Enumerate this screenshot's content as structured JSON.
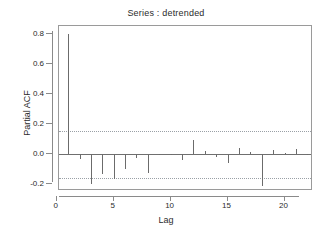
{
  "chart_data": {
    "type": "bar",
    "title": "Series : detrended",
    "xlabel": "Lag",
    "ylabel": "Partial ACF",
    "x": [
      1,
      2,
      3,
      4,
      5,
      6,
      7,
      8,
      9,
      10,
      11,
      12,
      13,
      14,
      15,
      16,
      17,
      18,
      19,
      20,
      21,
      22
    ],
    "values": [
      0.805,
      -0.03,
      -0.195,
      -0.13,
      -0.165,
      -0.095,
      -0.022,
      -0.125,
      -0.004,
      0.003,
      -0.04,
      0.095,
      0.025,
      -0.02,
      -0.06,
      0.04,
      0.012,
      -0.21,
      0.03,
      0.01,
      0.035,
      0.004
    ],
    "categories": [
      "1",
      "2",
      "3",
      "4",
      "5",
      "6",
      "7",
      "8",
      "9",
      "10",
      "11",
      "12",
      "13",
      "14",
      "15",
      "16",
      "17",
      "18",
      "19",
      "20",
      "21",
      "22"
    ],
    "xlim": [
      0.2,
      22.5
    ],
    "ylim": [
      -0.245,
      0.855
    ],
    "yticks": [
      0.8,
      0.6,
      0.4,
      0.2,
      0.0,
      -0.2
    ],
    "ytick_labels": [
      "0.8",
      "0.6",
      "0.4",
      "0.2",
      "0.0",
      "-0.2"
    ],
    "xticks": [
      0,
      5,
      10,
      15,
      20
    ],
    "xtick_labels": [
      "0",
      "5",
      "10",
      "15",
      "20"
    ],
    "confidence_levels": [
      0.155,
      -0.155
    ],
    "zero_line": 0.0,
    "grid": false,
    "legend": null,
    "colors": {
      "bar": "#6b6b6b",
      "confidence": "#9aa0a6",
      "axis": "#8a8a8a",
      "text": "#2b2b2b",
      "background": "#ffffff"
    }
  }
}
